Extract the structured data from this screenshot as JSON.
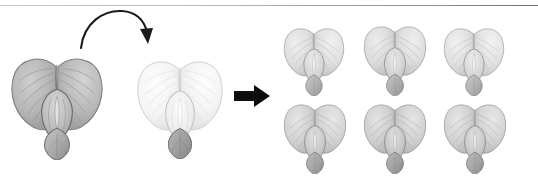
{
  "figure": {
    "background_color": "#ffffff",
    "width": 538,
    "height": 181,
    "top_rule_color": "#9a9a9a"
  },
  "parents": [
    {
      "id": "parent-1",
      "label": "Parent flower 1 (dark)",
      "shade": "dark",
      "petal_color": "#b4b4b4",
      "vein_color": "#8a8a8a",
      "outline_color": "#6f6f6f",
      "keel_color": "#a8a8a8",
      "x": 10,
      "y": 52,
      "width": 94,
      "height": 108
    },
    {
      "id": "parent-2",
      "label": "Parent flower 2 (light)",
      "shade": "light",
      "petal_color": "#f6f6f6",
      "vein_color": "#dcdcdc",
      "outline_color": "#c4c4c4",
      "keel_color": "#ededed",
      "x": 136,
      "y": 55,
      "width": 88,
      "height": 104
    }
  ],
  "offspring": [
    {
      "id": "offspring-1",
      "label": "Offspring flower 1",
      "shade": "medium-light",
      "petal_color": "#dedede",
      "vein_color": "#b0b0b0",
      "outline_color": "#8f8f8f",
      "keel_color": "#cfcfcf",
      "row": 1,
      "column": 1,
      "x": 283,
      "y": 24,
      "width": 62,
      "height": 72
    },
    {
      "id": "offspring-2",
      "label": "Offspring flower 2",
      "shade": "medium-light",
      "petal_color": "#dbdbdb",
      "vein_color": "#aeaeae",
      "outline_color": "#8d8d8d",
      "keel_color": "#cccccc",
      "row": 1,
      "column": 2,
      "x": 363,
      "y": 22,
      "width": 64,
      "height": 74
    },
    {
      "id": "offspring-3",
      "label": "Offspring flower 3",
      "shade": "medium-light",
      "petal_color": "#e0e0e0",
      "vein_color": "#b2b2b2",
      "outline_color": "#909090",
      "keel_color": "#d1d1d1",
      "row": 1,
      "column": 3,
      "x": 443,
      "y": 24,
      "width": 62,
      "height": 72
    },
    {
      "id": "offspring-4",
      "label": "Offspring flower 4",
      "shade": "medium",
      "petal_color": "#d2d2d2",
      "vein_color": "#a4a4a4",
      "outline_color": "#858585",
      "keel_color": "#c2c2c2",
      "row": 2,
      "column": 1,
      "x": 283,
      "y": 100,
      "width": 64,
      "height": 74
    },
    {
      "id": "offspring-5",
      "label": "Offspring flower 5",
      "shade": "medium",
      "petal_color": "#cfcfcf",
      "vein_color": "#a1a1a1",
      "outline_color": "#828282",
      "keel_color": "#bfbfbf",
      "row": 2,
      "column": 2,
      "x": 363,
      "y": 100,
      "width": 64,
      "height": 74
    },
    {
      "id": "offspring-6",
      "label": "Offspring flower 6",
      "shade": "medium",
      "petal_color": "#d2d2d2",
      "vein_color": "#a4a4a4",
      "outline_color": "#858585",
      "keel_color": "#c2c2c2",
      "row": 2,
      "column": 3,
      "x": 443,
      "y": 100,
      "width": 64,
      "height": 74
    }
  ],
  "arrows": [
    {
      "id": "pollination-arrow",
      "type": "curved",
      "label": "Curved pollination arrow from parent 1 to parent 2",
      "color": "#1a1a1a",
      "x": 78,
      "y": 8,
      "width": 78,
      "height": 42
    },
    {
      "id": "result-arrow",
      "type": "block",
      "label": "Block arrow pointing to offspring",
      "color": "#0d0d0d",
      "x": 234,
      "y": 84,
      "width": 36,
      "height": 24
    }
  ]
}
